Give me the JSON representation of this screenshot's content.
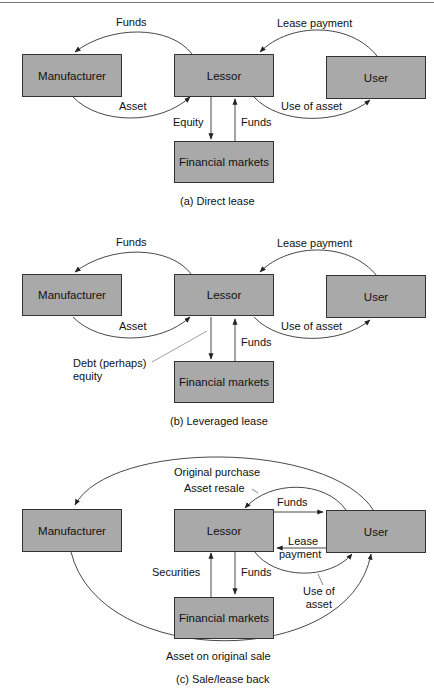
{
  "figure": {
    "panels": [
      {
        "id": "a",
        "caption": "(a)  Direct lease",
        "nodes": {
          "manufacturer": "Manufacturer",
          "lessor": "Lessor",
          "user": "User",
          "financial_markets": "Financial markets"
        },
        "flows": {
          "lessor_to_manufacturer": "Funds",
          "manufacturer_to_lessor": "Asset",
          "user_to_lessor": "Lease payment",
          "lessor_to_user": "Use of asset",
          "lessor_to_markets": "Equity",
          "markets_to_lessor": "Funds"
        }
      },
      {
        "id": "b",
        "caption": "(b)  Leveraged lease",
        "nodes": {
          "manufacturer": "Manufacturer",
          "lessor": "Lessor",
          "user": "User",
          "financial_markets": "Financial markets"
        },
        "flows": {
          "lessor_to_manufacturer": "Funds",
          "manufacturer_to_lessor": "Asset",
          "user_to_lessor": "Lease payment",
          "lessor_to_user": "Use of asset",
          "lessor_to_markets_line1": "Debt (perhaps)",
          "lessor_to_markets_line2": "equity",
          "markets_to_lessor": "Funds"
        }
      },
      {
        "id": "c",
        "caption": "(c)  Sale/lease back",
        "nodes": {
          "manufacturer": "Manufacturer",
          "lessor": "Lessor",
          "user": "User",
          "financial_markets": "Financial markets"
        },
        "flows": {
          "user_to_manufacturer": "Original purchase",
          "user_to_lessor": "Asset resale",
          "lessor_to_user_funds": "Funds",
          "user_to_lessor_payment_line1": "Lease",
          "user_to_lessor_payment_line2": "payment",
          "lessor_to_user_use_line1": "Use of",
          "lessor_to_user_use_line2": "asset",
          "markets_to_lessor": "Securities",
          "lessor_to_markets": "Funds",
          "manufacturer_to_user": "Asset on original sale"
        }
      }
    ]
  }
}
